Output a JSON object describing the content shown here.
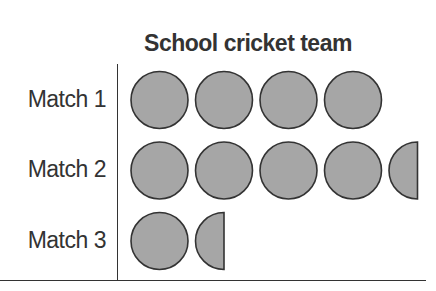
{
  "chart_data": {
    "type": "pictograph",
    "title": "School cricket team",
    "categories": [
      "Match 1",
      "Match 2",
      "Match 3"
    ],
    "values": [
      4,
      4.5,
      1.5
    ],
    "symbol": "circle",
    "symbol_color": "#a6a6a6",
    "symbol_stroke": "#333333",
    "xlabel": "",
    "ylabel": "",
    "legend": null
  },
  "title": "School cricket team",
  "rows": [
    {
      "label": "Match 1",
      "full": 4,
      "half": 0
    },
    {
      "label": "Match 2",
      "full": 4,
      "half": 1
    },
    {
      "label": "Match 3",
      "full": 1,
      "half": 1
    }
  ]
}
